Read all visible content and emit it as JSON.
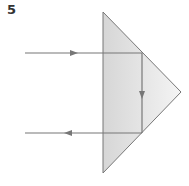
{
  "figure": {
    "number": "5"
  },
  "colors": {
    "line": "#777777",
    "prism_fill_left": "#d6d6d6",
    "prism_fill_right": "#f4f4f4",
    "background": "#ffffff",
    "label": "#333333"
  },
  "prism": {
    "shape": "right-angled isosceles triangle",
    "vertices": [
      [
        103,
        12
      ],
      [
        181,
        92
      ],
      [
        103,
        173
      ]
    ]
  },
  "rays": [
    {
      "name": "incident-ray",
      "from": [
        25,
        53
      ],
      "to": [
        142,
        53
      ],
      "arrow_at": [
        75,
        53
      ],
      "direction": "right"
    },
    {
      "name": "reflected-ray-internal",
      "from": [
        142,
        53
      ],
      "to": [
        142,
        133
      ],
      "arrow_at": [
        142,
        95
      ],
      "direction": "down"
    },
    {
      "name": "emergent-ray",
      "from": [
        142,
        133
      ],
      "to": [
        25,
        133
      ],
      "arrow_at": [
        67,
        133
      ],
      "direction": "left"
    }
  ]
}
